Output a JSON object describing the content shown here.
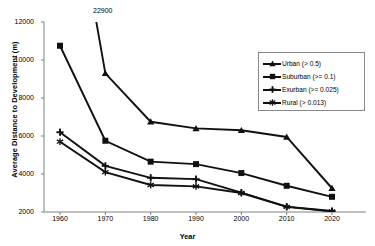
{
  "chart_data": {
    "type": "line",
    "title": "",
    "xlabel": "Year",
    "ylabel": "Average Distance to Development (m)",
    "categories": [
      1960,
      1970,
      1980,
      1990,
      2000,
      2010,
      2020
    ],
    "x": [
      1960,
      1970,
      1980,
      1990,
      2000,
      2010,
      2020
    ],
    "xlim": [
      1955,
      2025
    ],
    "ylim": [
      2000,
      12000
    ],
    "ytick_labels": [
      "12000",
      "10000",
      "8000",
      "6000",
      "4000",
      "2000"
    ],
    "yticks": [
      12000,
      10000,
      8000,
      6000,
      4000,
      2000
    ],
    "xtick_labels": [
      "1960",
      "1970",
      "1980",
      "1990",
      "2000",
      "2010",
      "2020"
    ],
    "grid": false,
    "legend_position": "right-top",
    "annotations": [
      {
        "text": "22900",
        "x": 1960,
        "y": 22900,
        "note": "off-scale first Urban point"
      }
    ],
    "series": [
      {
        "name": "Urban (> 0.5)",
        "marker": "triangle",
        "values": [
          22900,
          9300,
          6750,
          6400,
          6300,
          5950,
          3250
        ]
      },
      {
        "name": "Suburban (>= 0.1)",
        "marker": "square",
        "values": [
          10750,
          5750,
          4650,
          4520,
          4050,
          3380,
          2800
        ]
      },
      {
        "name": "Exurban (>= 0.025)",
        "marker": "plus",
        "values": [
          6200,
          4430,
          3800,
          3730,
          3020,
          2280,
          2050
        ]
      },
      {
        "name": "Rural (> 0.013)",
        "marker": "asterisk",
        "values": [
          5700,
          4100,
          3420,
          3350,
          3000,
          2270,
          2030
        ]
      }
    ],
    "colors": {
      "line": "#111111",
      "axis": "#808080",
      "text": "#000000",
      "legend_border": "#888888",
      "background": "#ffffff"
    }
  },
  "legend": {
    "items": [
      {
        "label": "Urban (> 0.5)"
      },
      {
        "label": "Suburban (>= 0.1)"
      },
      {
        "label": "Exurban (>= 0.025)"
      },
      {
        "label": "Rural (> 0.013)"
      }
    ]
  }
}
